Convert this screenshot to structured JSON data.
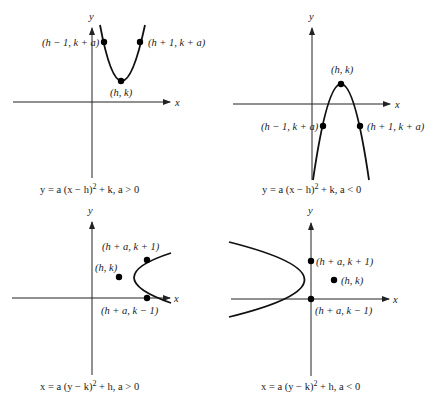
{
  "panels": [
    {
      "id": "top-left",
      "axis_x_label": "x",
      "axis_y_label": "y",
      "points": [
        {
          "label": "(h − 1, k + a)"
        },
        {
          "label": "(h + 1, k + a)"
        },
        {
          "label": "(h, k)"
        }
      ],
      "caption_pre": "y = a (x − h)",
      "caption_exp": "2",
      "caption_post": " + k, a > 0"
    },
    {
      "id": "top-right",
      "axis_x_label": "x",
      "axis_y_label": "y",
      "points": [
        {
          "label": "(h, k)"
        },
        {
          "label": "(h − 1, k + a)"
        },
        {
          "label": "(h + 1, k + a)"
        }
      ],
      "caption_pre": "y = a (x − h)",
      "caption_exp": "2",
      "caption_post": " + k, a < 0"
    },
    {
      "id": "bottom-left",
      "axis_x_label": "x",
      "axis_y_label": "y",
      "points": [
        {
          "label": "(h + a, k + 1)"
        },
        {
          "label": "(h, k)"
        },
        {
          "label": "(h + a, k − 1)"
        }
      ],
      "caption_pre": "x = a (y − k)",
      "caption_exp": "2",
      "caption_post": " + h, a > 0"
    },
    {
      "id": "bottom-right",
      "axis_x_label": "x",
      "axis_y_label": "y",
      "points": [
        {
          "label": "(h + a, k + 1)"
        },
        {
          "label": "(h, k)"
        },
        {
          "label": "(h + a, k − 1)"
        }
      ],
      "caption_pre": "x = a (y − k)",
      "caption_exp": "2",
      "caption_post": " + h, a < 0"
    }
  ]
}
